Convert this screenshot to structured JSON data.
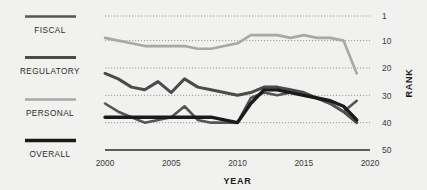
{
  "legend": {
    "items": [
      {
        "label": "FISCAL",
        "color": "#555555",
        "width": 2.6,
        "key": "fiscal"
      },
      {
        "label": "REGULATORY",
        "color": "#4a4a4a",
        "width": 3.0,
        "key": "regulatory"
      },
      {
        "label": "PERSONAL",
        "color": "#a8a8a8",
        "width": 2.6,
        "key": "personal"
      },
      {
        "label": "OVERALL",
        "color": "#1a1a1a",
        "width": 3.4,
        "key": "overall"
      }
    ]
  },
  "chart_data": {
    "type": "line",
    "title": "",
    "xlabel": "YEAR",
    "ylabel": "RANK",
    "xlim": [
      2000,
      2020
    ],
    "ylim": [
      1,
      50
    ],
    "y_inverted": true,
    "grid": "dotted-horizontal",
    "legend_position": "left",
    "xticks": [
      2000,
      2005,
      2010,
      2015,
      2020
    ],
    "yticks": [
      1,
      10,
      20,
      30,
      40,
      50
    ],
    "x": [
      2000,
      2001,
      2002,
      2003,
      2004,
      2005,
      2006,
      2007,
      2008,
      2009,
      2010,
      2011,
      2012,
      2013,
      2014,
      2015,
      2016,
      2017,
      2018,
      2019
    ],
    "series": [
      {
        "name": "PERSONAL",
        "color": "#a8a8a8",
        "width": 2.6,
        "values": [
          9,
          10,
          11,
          12,
          12,
          12,
          12,
          13,
          13,
          12,
          11,
          8,
          8,
          8,
          9,
          8,
          9,
          9,
          10,
          22
        ]
      },
      {
        "name": "REGULATORY",
        "color": "#4a4a4a",
        "width": 3.0,
        "values": [
          22,
          24,
          27,
          28,
          25,
          29,
          24,
          27,
          28,
          29,
          30,
          29,
          27,
          27,
          28,
          29,
          31,
          33,
          36,
          40
        ]
      },
      {
        "name": "FISCAL",
        "color": "#555555",
        "width": 2.6,
        "values": [
          33,
          36,
          38,
          40,
          39,
          38,
          34,
          39,
          40,
          40,
          40,
          31,
          29,
          30,
          29,
          30,
          31,
          33,
          36,
          32
        ]
      },
      {
        "name": "OVERALL",
        "color": "#1a1a1a",
        "width": 3.4,
        "values": [
          38,
          38,
          38,
          38,
          38,
          38,
          38,
          38,
          38,
          39,
          40,
          33,
          28,
          28,
          29,
          30,
          31,
          32,
          34,
          39
        ]
      }
    ]
  }
}
